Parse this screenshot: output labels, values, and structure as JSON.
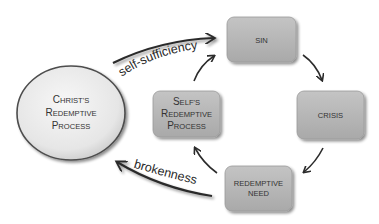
{
  "diagram": {
    "center_node": {
      "label_lines": [
        "Christ's",
        "Redemptive",
        "Process"
      ]
    },
    "cycle_nodes": [
      {
        "id": "sin",
        "label_lines": [
          "SIN"
        ]
      },
      {
        "id": "crisis",
        "label_lines": [
          "CRISIS"
        ]
      },
      {
        "id": "redemptive-need",
        "label_lines": [
          "REDEMPTIVE",
          "NEED"
        ]
      },
      {
        "id": "selfs-redemptive-process",
        "label_lines": [
          "Self's",
          "Redemptive",
          "Process"
        ]
      }
    ],
    "edges": [
      {
        "from": "sin",
        "to": "crisis"
      },
      {
        "from": "crisis",
        "to": "redemptive-need"
      },
      {
        "from": "redemptive-need",
        "to": "selfs-redemptive-process"
      },
      {
        "from": "selfs-redemptive-process",
        "to": "sin"
      },
      {
        "from": "christs-redemptive-process",
        "to": "sin",
        "label": "self-sufficiency"
      },
      {
        "from": "redemptive-need",
        "to": "christs-redemptive-process",
        "label": "brokenness"
      }
    ],
    "labels": {
      "self_sufficiency": "self-sufficiency",
      "brokenness": "brokenness"
    },
    "colors": {
      "box_fill": "#b3b3b3",
      "box_stroke": "#8c8c8c",
      "circle_fill": "#ededed",
      "circle_stroke": "#555555",
      "arrow": "#2b2b2b",
      "text": "#333333"
    }
  }
}
